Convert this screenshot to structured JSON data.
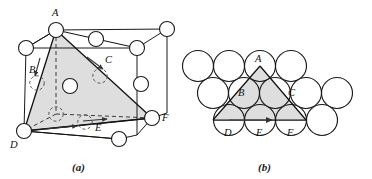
{
  "figure": {
    "title_a": "(a)",
    "title_b": "(b)",
    "panels": [
      {
        "id": "a",
        "caption": "(a)",
        "kind": "fcc-unit-cell-with-slip-plane",
        "vertex_labels": [
          "A",
          "B",
          "C",
          "D",
          "E",
          "F"
        ],
        "labels": {
          "A": "A",
          "B": "B",
          "C": "C",
          "D": "D",
          "E": "E",
          "F": "F"
        }
      },
      {
        "id": "b",
        "caption": "(b)",
        "kind": "close-packed-plane",
        "vertex_labels": [
          "A",
          "B",
          "C",
          "D",
          "E",
          "F"
        ],
        "labels": {
          "A": "A",
          "B": "B",
          "C": "C",
          "D": "D",
          "E": "E",
          "F": "F"
        }
      }
    ]
  },
  "style": {
    "line_color": "#1a1a1a",
    "atom_fill": "#ffffff",
    "plane_fill": "#dedede",
    "background": "#ffffff",
    "dashed_color": "#444444"
  },
  "geometry": {
    "panel_a": {
      "cube_front": [
        [
          22,
          129
        ],
        [
          133,
          129
        ],
        [
          133,
          28
        ],
        [
          22,
          28
        ]
      ],
      "cube_back_offset": [
        30,
        -22
      ],
      "slip_triangle": [
        "A",
        "D",
        "F"
      ],
      "atom_radius": 7.5,
      "corner_atoms": [
        {
          "name": "A",
          "cx": 56,
          "cy": 30
        },
        {
          "name": "D",
          "cx": 24,
          "cy": 131
        },
        {
          "name": "F",
          "cx": 152,
          "cy": 118
        },
        {
          "name": "top-back-left",
          "cx": 26,
          "cy": 48
        },
        {
          "name": "top-back-right",
          "cx": 137,
          "cy": 48
        },
        {
          "name": "top-front-right",
          "cx": 167,
          "cy": 29
        },
        {
          "name": "bottom-front-right",
          "cx": 119,
          "cy": 139
        },
        {
          "name": "bottom-back-left-hidden",
          "cx": 56,
          "cy": 114
        }
      ],
      "face_atoms": [
        {
          "name": "top-face",
          "cx": 96,
          "cy": 39
        },
        {
          "name": "front-face",
          "cx": 74,
          "cy": 86
        },
        {
          "name": "right-face",
          "cx": 141,
          "cy": 84
        }
      ]
    },
    "panel_b": {
      "atom_radius": 15.5,
      "rows": [
        {
          "row": 0,
          "cy": 66,
          "cx": [
            198,
            229,
            260,
            291
          ]
        },
        {
          "row": 1,
          "cy": 93,
          "cx": [
            213,
            244,
            275,
            306,
            337
          ]
        },
        {
          "row": 2,
          "cy": 120,
          "cx": [
            229,
            260,
            291,
            322
          ]
        }
      ],
      "triangle": [
        [
          260,
          66
        ],
        [
          213,
          120
        ],
        [
          306,
          120
        ]
      ],
      "label_points": {
        "A": [
          260,
          62
        ],
        "B": [
          235,
          92
        ],
        "C": [
          285,
          92
        ],
        "D": [
          229,
          128
        ],
        "E": [
          260,
          128
        ],
        "F": [
          291,
          128
        ]
      }
    }
  }
}
